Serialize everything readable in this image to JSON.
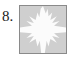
{
  "item": {
    "number_label": "8.",
    "kind": "figure-item"
  },
  "tile": {
    "background_color": "#cfcfcf",
    "border_color": "#8a8a8a",
    "shape_color": "#fbfbfb",
    "shape_name": "jagged-four-pointed-star",
    "shape_description": "White four-armed jagged star cross centered on a gray square",
    "width": 48,
    "height": 49
  },
  "page": {
    "background_color": "#ffffff",
    "width": 72,
    "height": 59
  }
}
